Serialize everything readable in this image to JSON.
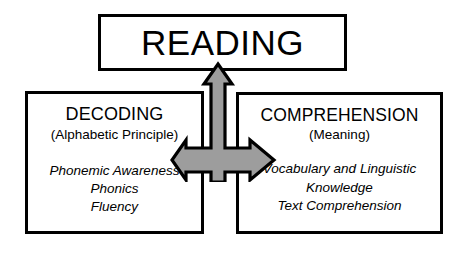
{
  "diagram": {
    "type": "hierarchy-diagram",
    "background_color": "#ffffff",
    "line_color": "#000000",
    "arrow_fill_color": "#9d9d9d",
    "arrow_stroke_color": "#000000"
  },
  "top_node": {
    "label": "READING"
  },
  "left_node": {
    "heading": "DECODING",
    "subheading": "(Alphabetic Principle)",
    "details": [
      "Phonemic Awareness",
      "Phonics",
      "Fluency"
    ]
  },
  "right_node": {
    "heading": "COMPREHENSION",
    "subheading": "(Meaning)",
    "details": [
      "Vocabulary and Linguistic",
      "Knowledge",
      "Text Comprehension"
    ]
  },
  "connector": {
    "name": "cross-arrow",
    "directions": [
      "up",
      "left",
      "right"
    ]
  }
}
